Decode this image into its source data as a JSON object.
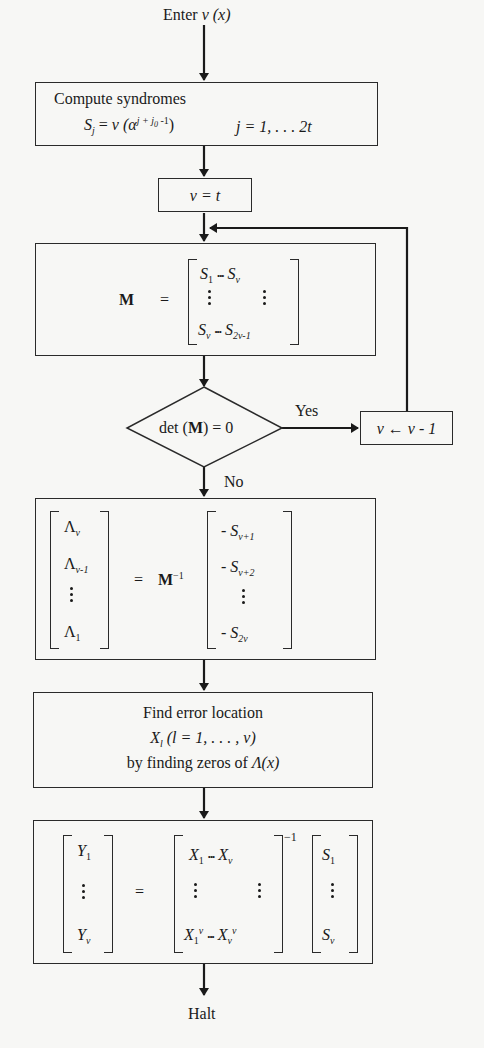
{
  "figure": {
    "type": "flowchart",
    "colors": {
      "background": "#f7f7f5",
      "line": "#2a2a2a",
      "text": "#1a1a1a"
    }
  },
  "start": {
    "label_prefix": "Enter ",
    "label_var": "v",
    "label_arg": " (x)"
  },
  "syndromes": {
    "title": "Compute syndromes",
    "lhs": "S",
    "lhs_sub": "j",
    "eq": " = ",
    "func": "v",
    "open": " (α",
    "exp": "j + j",
    "exp_sub": "0",
    "exp_tail": " -1",
    "close": ")",
    "range": "j = 1, . . . 2t"
  },
  "init": {
    "label": "ν = t"
  },
  "matrix_m": {
    "name": "M",
    "eq": "=",
    "row1_left": "S",
    "row1_left_sub": "1",
    "row1_right": "S",
    "row1_right_sub": "ν",
    "row2_left": "S",
    "row2_left_sub": "ν",
    "row2_right": "S",
    "row2_right_sub": "2ν-1",
    "ellipsis": "•••"
  },
  "decision": {
    "label_pre": "det (",
    "label_m": "M",
    "label_post": ") = 0",
    "yes": "Yes",
    "no": "No"
  },
  "decrement": {
    "label": "ν ← ν - 1"
  },
  "lambda_solve": {
    "lhs": [
      {
        "sym": "Λ",
        "sub": "ν"
      },
      {
        "sym": "Λ",
        "sub": "ν-1"
      },
      {
        "sym": "Λ",
        "sub": "1"
      }
    ],
    "eq": "=",
    "m": "M",
    "m_sup": "−1",
    "rhs": [
      {
        "sign": "- ",
        "sym": "S",
        "sub": "ν+1"
      },
      {
        "sign": "- ",
        "sym": "S",
        "sub": "ν+2"
      },
      {
        "sign": "- ",
        "sym": "S",
        "sub": "2ν"
      }
    ]
  },
  "locate": {
    "line1": "Find error location",
    "line2_sym": "X",
    "line2_sub": "l",
    "line2_rest": " (l = 1, . . . , ν)",
    "line3_pre": "by finding zeros of ",
    "line3_func": "Λ(x)"
  },
  "values_solve": {
    "y_top": "Y",
    "y_top_sub": "1",
    "y_bot": "Y",
    "y_bot_sub": "ν",
    "eq": "=",
    "x_r1_l": "X",
    "x_r1_l_sub": "1",
    "x_r1_r": "X",
    "x_r1_r_sub": "ν",
    "x_r2_l": "X",
    "x_r2_l_sub": "1",
    "x_r2_l_sup": "ν",
    "x_r2_r": "X",
    "x_r2_r_sub": "ν",
    "x_r2_r_sup": "ν",
    "ellipsis": "•••",
    "inv": "−1",
    "s_top": "S",
    "s_top_sub": "1",
    "s_bot": "S",
    "s_bot_sub": "ν"
  },
  "end": {
    "label": "Halt"
  }
}
